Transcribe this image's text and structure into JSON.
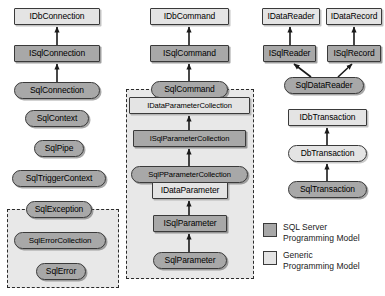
{
  "diagram": {
    "colors": {
      "sql_server_fill": "#a8a8a8",
      "generic_fill": "#e4e4e4",
      "group_fill": "#e8e8e8",
      "border": "#3a3a3a",
      "arrow": "#1a1a1a",
      "background": "#ffffff"
    },
    "nodes": [
      {
        "id": "idbconnection",
        "label": "IDbConnection",
        "shape": "rect",
        "model": "generic",
        "x": 14,
        "y": 8,
        "w": 86,
        "h": 17
      },
      {
        "id": "isqlconnection",
        "label": "ISqlConnection",
        "shape": "rect",
        "model": "sql",
        "x": 14,
        "y": 45,
        "w": 86,
        "h": 17
      },
      {
        "id": "sqlconnection",
        "label": "SqlConnection",
        "shape": "rounded",
        "model": "sql",
        "x": 14,
        "y": 82,
        "w": 86,
        "h": 17
      },
      {
        "id": "sqlcontext",
        "label": "SqlContext",
        "shape": "rounded",
        "model": "sql",
        "x": 25,
        "y": 110,
        "w": 64,
        "h": 17
      },
      {
        "id": "sqlpipe",
        "label": "SqlPipe",
        "shape": "rounded",
        "model": "sql",
        "x": 34,
        "y": 140,
        "w": 50,
        "h": 17
      },
      {
        "id": "sqltriggercontext",
        "label": "SqlTriggerContext",
        "shape": "rounded",
        "model": "sql",
        "x": 12,
        "y": 170,
        "w": 94,
        "h": 17
      },
      {
        "id": "sqlexception",
        "label": "SqlException",
        "shape": "rounded",
        "model": "sql",
        "x": 26,
        "y": 201,
        "w": 66,
        "h": 17
      },
      {
        "id": "sqlerrorcollection",
        "label": "SqlErrorCollection",
        "shape": "rounded",
        "model": "sql",
        "x": 14,
        "y": 232,
        "w": 92,
        "h": 17
      },
      {
        "id": "sqlerror",
        "label": "SqlError",
        "shape": "rounded",
        "model": "sql",
        "x": 36,
        "y": 263,
        "w": 50,
        "h": 17
      },
      {
        "id": "idbcommand",
        "label": "IDbCommand",
        "shape": "rect",
        "model": "generic",
        "x": 150,
        "y": 8,
        "w": 79,
        "h": 17
      },
      {
        "id": "isqlcommand",
        "label": "ISqlCommand",
        "shape": "rect",
        "model": "sql",
        "x": 150,
        "y": 45,
        "w": 79,
        "h": 17
      },
      {
        "id": "sqlcommand",
        "label": "SqlCommand",
        "shape": "rounded",
        "model": "sql",
        "x": 151,
        "y": 81,
        "w": 77,
        "h": 17
      },
      {
        "id": "idataparametercollection",
        "label": "IDataParameterCollection",
        "shape": "rect",
        "model": "generic",
        "x": 129,
        "y": 97,
        "w": 121,
        "h": 17
      },
      {
        "id": "isqlparametercollection",
        "label": "ISqlParameterCollection",
        "shape": "rect",
        "model": "sql",
        "x": 133,
        "y": 130,
        "w": 113,
        "h": 17
      },
      {
        "id": "sqlpparametercollection",
        "label": "SqlPParameterCollection",
        "shape": "rounded",
        "model": "sql",
        "x": 131,
        "y": 166,
        "w": 117,
        "h": 17
      },
      {
        "id": "idataparameter",
        "label": "IDataParameter",
        "shape": "rect",
        "model": "generic",
        "x": 152,
        "y": 182,
        "w": 76,
        "h": 17
      },
      {
        "id": "isqlparameter",
        "label": "ISqlParameter",
        "shape": "rect",
        "model": "sql",
        "x": 153,
        "y": 215,
        "w": 74,
        "h": 17
      },
      {
        "id": "sqlparameter",
        "label": "SqlParameter",
        "shape": "rounded",
        "model": "sql",
        "x": 153,
        "y": 252,
        "w": 74,
        "h": 17
      },
      {
        "id": "idatareader",
        "label": "IDataReader",
        "shape": "rect",
        "model": "generic",
        "x": 262,
        "y": 8,
        "w": 58,
        "h": 17
      },
      {
        "id": "idatarecord",
        "label": "IDataRecord",
        "shape": "rect",
        "model": "generic",
        "x": 326,
        "y": 8,
        "w": 56,
        "h": 17
      },
      {
        "id": "isqlreader",
        "label": "ISqlReader",
        "shape": "rect",
        "model": "sql",
        "x": 263,
        "y": 45,
        "w": 53,
        "h": 17
      },
      {
        "id": "isqlrecord",
        "label": "ISqlRecord",
        "shape": "rect",
        "model": "sql",
        "x": 327,
        "y": 45,
        "w": 54,
        "h": 17
      },
      {
        "id": "sqldatareader",
        "label": "SqlDataReader",
        "shape": "rounded",
        "model": "sql",
        "x": 284,
        "y": 77,
        "w": 80,
        "h": 17
      },
      {
        "id": "idbtransaction",
        "label": "IDbTransaction",
        "shape": "rect",
        "model": "generic",
        "x": 288,
        "y": 109,
        "w": 79,
        "h": 17
      },
      {
        "id": "dbtransaction",
        "label": "DbTransaction",
        "shape": "rounded",
        "model": "generic",
        "x": 288,
        "y": 145,
        "w": 79,
        "h": 17
      },
      {
        "id": "sqltransaction",
        "label": "SqlTransaction",
        "shape": "rounded",
        "model": "sql",
        "x": 288,
        "y": 181,
        "w": 79,
        "h": 17
      }
    ],
    "groups": [
      {
        "id": "error-group",
        "x": 7,
        "y": 209,
        "w": 112,
        "h": 79
      },
      {
        "id": "parameter-group",
        "x": 126,
        "y": 89,
        "w": 128,
        "h": 190
      }
    ],
    "arrows": [
      {
        "from": "isqlconnection",
        "to": "idbconnection",
        "x1": 57,
        "y1": 45,
        "x2": 57,
        "y2": 27
      },
      {
        "from": "sqlconnection",
        "to": "isqlconnection",
        "x1": 57,
        "y1": 82,
        "x2": 57,
        "y2": 64
      },
      {
        "from": "isqlcommand",
        "to": "idbcommand",
        "x1": 189,
        "y1": 45,
        "x2": 189,
        "y2": 27
      },
      {
        "from": "sqlcommand",
        "to": "isqlcommand",
        "x1": 189,
        "y1": 81,
        "x2": 189,
        "y2": 64
      },
      {
        "from": "isqlparametercollection",
        "to": "idataparametercollection",
        "x1": 189,
        "y1": 130,
        "x2": 189,
        "y2": 116
      },
      {
        "from": "sqlpparametercollection",
        "to": "isqlparametercollection",
        "x1": 189,
        "y1": 166,
        "x2": 189,
        "y2": 149
      },
      {
        "from": "isqlparameter",
        "to": "idataparameter",
        "x1": 189,
        "y1": 215,
        "x2": 189,
        "y2": 201
      },
      {
        "from": "sqlparameter",
        "to": "isqlparameter",
        "x1": 189,
        "y1": 252,
        "x2": 189,
        "y2": 234
      },
      {
        "from": "isqlreader",
        "to": "idatareader",
        "x1": 290,
        "y1": 45,
        "x2": 290,
        "y2": 27
      },
      {
        "from": "isqlrecord",
        "to": "idatarecord",
        "x1": 354,
        "y1": 45,
        "x2": 354,
        "y2": 27
      },
      {
        "from": "sqldatareader",
        "to": "isqlreader",
        "x1": 311,
        "y1": 77,
        "x2": 294,
        "y2": 64
      },
      {
        "from": "sqldatareader",
        "to": "isqlrecord",
        "x1": 338,
        "y1": 77,
        "x2": 352,
        "y2": 64
      },
      {
        "from": "dbtransaction",
        "to": "idbtransaction",
        "x1": 327,
        "y1": 145,
        "x2": 327,
        "y2": 128
      },
      {
        "from": "sqltransaction",
        "to": "dbtransaction",
        "x1": 327,
        "y1": 181,
        "x2": 327,
        "y2": 164
      }
    ]
  },
  "legend": {
    "x": 263,
    "y": 222,
    "items": [
      {
        "id": "sql-server",
        "swatch": "#a8a8a8",
        "label": "SQL Server\nProgramming Model"
      },
      {
        "id": "generic",
        "swatch": "#e4e4e4",
        "label": "Generic\nProgramming Model"
      }
    ]
  }
}
